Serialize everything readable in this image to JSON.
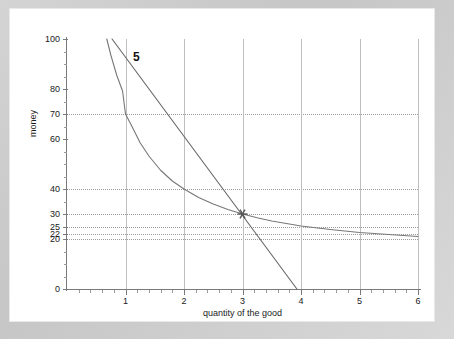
{
  "chart": {
    "type": "line",
    "title": "",
    "xlabel": "quantity of the good",
    "ylabel": "money",
    "xlim": [
      0,
      6
    ],
    "ylim": [
      0,
      100
    ],
    "grid": "vertical solid gridlines at integer x; dotted horizontal gridlines at labelled y values",
    "legend": "none",
    "x_ticks": [
      {
        "value": 1,
        "label": "1"
      },
      {
        "value": 2,
        "label": "2"
      },
      {
        "value": 3,
        "label": "3"
      },
      {
        "value": 4,
        "label": "4"
      },
      {
        "value": 5,
        "label": "5"
      },
      {
        "value": 6,
        "label": "6"
      }
    ],
    "y_ticks": [
      {
        "value": 0,
        "label": "0",
        "gridline": false
      },
      {
        "value": 20,
        "label": "20",
        "gridline": true
      },
      {
        "value": 22,
        "label": "22",
        "gridline": true
      },
      {
        "value": 25,
        "label": "25",
        "gridline": true
      },
      {
        "value": 30,
        "label": "30",
        "gridline": true
      },
      {
        "value": 40,
        "label": "40",
        "gridline": true
      },
      {
        "value": 60,
        "label": "60",
        "gridline": false
      },
      {
        "value": 70,
        "label": "70",
        "gridline": true
      },
      {
        "value": 80,
        "label": "80",
        "gridline": false
      },
      {
        "value": 100,
        "label": "100",
        "gridline": false
      }
    ],
    "annotations": [
      {
        "name": "curve-label-5",
        "text": "5",
        "x": 1.13,
        "y": 93
      }
    ],
    "markers": [
      {
        "name": "optimum-point",
        "symbol": "asterisk",
        "x": 3,
        "y": 30,
        "color": "#555555"
      }
    ],
    "series": [
      {
        "name": "indifference-curve",
        "type": "curve",
        "color": "#777777",
        "points": [
          [
            0.68,
            100
          ],
          [
            0.75,
            93.5
          ],
          [
            0.85,
            85.5
          ],
          [
            0.95,
            79.2
          ],
          [
            1.0,
            70.0
          ],
          [
            1.1,
            65.5
          ],
          [
            1.25,
            58.5
          ],
          [
            1.4,
            53.2
          ],
          [
            1.6,
            47.5
          ],
          [
            1.8,
            43.2
          ],
          [
            2.0,
            40.0
          ],
          [
            2.25,
            36.6
          ],
          [
            2.5,
            34.0
          ],
          [
            2.75,
            31.8
          ],
          [
            3.0,
            30.0
          ],
          [
            3.25,
            28.5
          ],
          [
            3.5,
            27.2
          ],
          [
            4.0,
            25.2
          ],
          [
            4.5,
            23.8
          ],
          [
            5.0,
            22.6
          ],
          [
            5.5,
            21.8
          ],
          [
            6.0,
            21.0
          ]
        ]
      },
      {
        "name": "budget-line",
        "type": "line",
        "color": "#666666",
        "points": [
          [
            0.77,
            100
          ],
          [
            3.93,
            0
          ]
        ]
      }
    ]
  }
}
